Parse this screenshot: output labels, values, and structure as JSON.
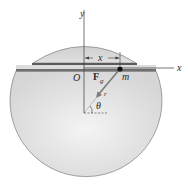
{
  "diagram": {
    "labels": {
      "y_axis": "y",
      "x_axis": "x",
      "origin": "O",
      "displacement": "x",
      "force_main": "F",
      "force_sub": "g",
      "mass": "m",
      "radius": "r",
      "angle": "θ"
    },
    "colors": {
      "sphere_fill": "#e4e4e4",
      "sphere_edge": "#8a8a8a",
      "tunnel": "#6f6f6f",
      "axis": "#3a3a3a",
      "arrow": "#7a7a7a",
      "mass_dot": "#111111"
    }
  }
}
